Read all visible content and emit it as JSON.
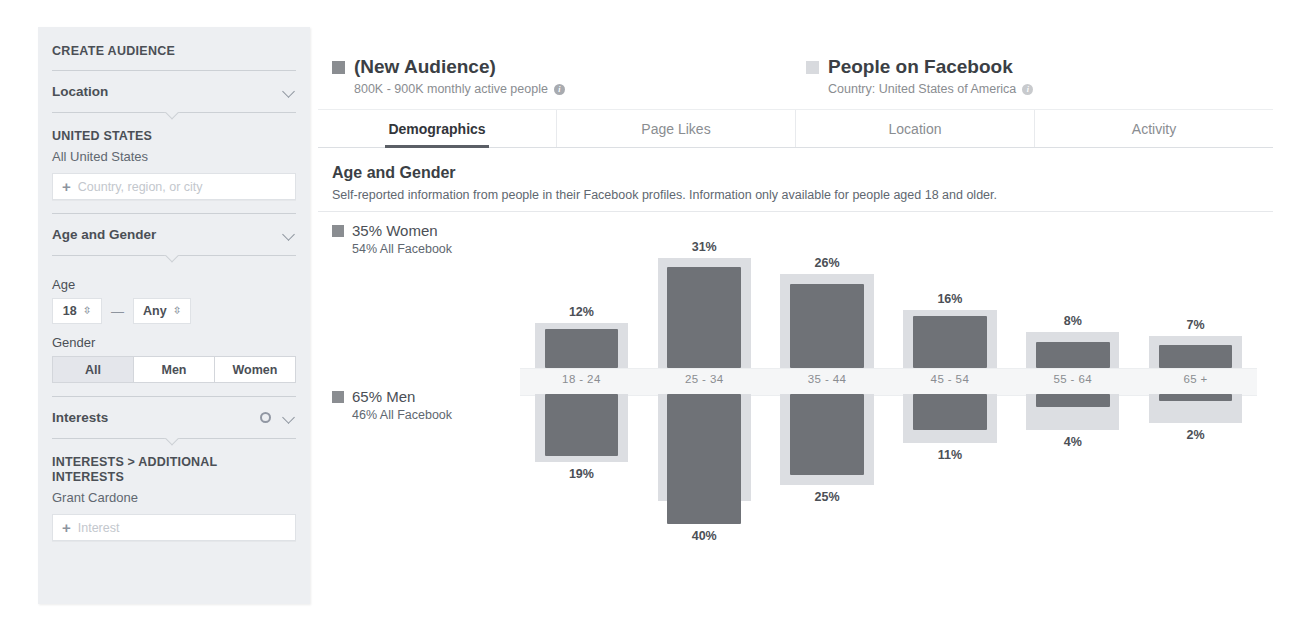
{
  "sidebar": {
    "title": "CREATE AUDIENCE",
    "sections": {
      "location": {
        "label": "Location",
        "chevron_icon": "chevron-down-icon",
        "heading": "UNITED STATES",
        "subheading": "All United States",
        "input_placeholder": "Country, region, or city",
        "add_icon": "plus-icon"
      },
      "age_gender": {
        "label": "Age and Gender",
        "chevron_icon": "chevron-down-icon",
        "age_label": "Age",
        "age_min": "18",
        "age_max": "Any",
        "stepper_icon": "up-down-arrows-icon",
        "range_dash": "—",
        "gender_label": "Gender",
        "gender_options": [
          "All",
          "Men",
          "Women"
        ],
        "gender_selected": "All"
      },
      "interests": {
        "label": "Interests",
        "gear_icon": "gear-icon",
        "chevron_icon": "chevron-down-icon",
        "heading": "INTERESTS > ADDITIONAL INTERESTS",
        "selected": "Grant Cardone",
        "input_placeholder": "Interest",
        "add_icon": "plus-icon"
      }
    }
  },
  "header": {
    "audience": {
      "swatch_color": "#8a8d91",
      "title": "(New Audience)",
      "subtitle": "800K - 900K monthly active people",
      "info_icon": "info-icon"
    },
    "comparison": {
      "swatch_color": "#d8dade",
      "title": "People on Facebook",
      "subtitle": "Country: United States of America",
      "info_icon": "info-icon"
    }
  },
  "tabs": [
    {
      "label": "Demographics",
      "active": true
    },
    {
      "label": "Page Likes",
      "active": false
    },
    {
      "label": "Location",
      "active": false
    },
    {
      "label": "Activity",
      "active": false
    }
  ],
  "section": {
    "title": "Age and Gender",
    "description": "Self-reported information from people in their Facebook profiles. Information only available for people aged 18 and older."
  },
  "legend": {
    "women": {
      "swatch_color": "#8a8d91",
      "main": "35% Women",
      "sub": "54% All Facebook"
    },
    "men": {
      "swatch_color": "#6f7277",
      "main": "65% Men",
      "sub": "46% All Facebook"
    }
  },
  "chart_data": {
    "type": "bar",
    "title": "Age and Gender",
    "xlabel": "",
    "ylabel": "",
    "grid": false,
    "legend_position": "left",
    "categories": [
      "18 - 24",
      "25 - 34",
      "35 - 44",
      "45 - 54",
      "55 - 64",
      "65 +"
    ],
    "series": [
      {
        "name": "35% Women",
        "direction": "up",
        "color": "#6f7277",
        "values": [
          12,
          31,
          26,
          16,
          8,
          7
        ],
        "labels": [
          "12%",
          "31%",
          "26%",
          "16%",
          "8%",
          "7%"
        ]
      },
      {
        "name": "65% Men",
        "direction": "down",
        "color": "#6f7277",
        "values": [
          19,
          40,
          25,
          11,
          4,
          2
        ],
        "labels": [
          "19%",
          "40%",
          "25%",
          "11%",
          "4%",
          "2%"
        ]
      },
      {
        "name": "54% All Facebook (Women)",
        "direction": "up",
        "color": "#dcdee2",
        "values": [
          14,
          34,
          29,
          18,
          11,
          10
        ],
        "labels": []
      },
      {
        "name": "46% All Facebook (Men)",
        "direction": "down",
        "color": "#dcdee2",
        "values": [
          21,
          33,
          28,
          15,
          11,
          9
        ],
        "labels": []
      }
    ],
    "ylim": [
      0,
      42
    ]
  }
}
